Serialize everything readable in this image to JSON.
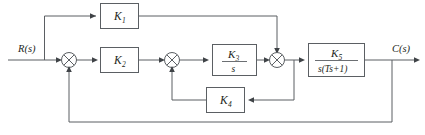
{
  "diagram": {
    "type": "block-diagram",
    "line_color": "#5b5f63",
    "text_color": "#1d1f21",
    "background": "#ffffff",
    "signals": {
      "input_label": "R(s)",
      "output_label": "C(s)"
    },
    "blocks": [
      {
        "id": "k1",
        "label": "K",
        "subscript": "1",
        "path": "feedforward-top"
      },
      {
        "id": "k2",
        "label": "K",
        "subscript": "2",
        "path": "forward-main"
      },
      {
        "id": "k3",
        "numerator": "K",
        "numerator_sub": "3",
        "denominator": "s",
        "path": "forward-main",
        "is_fraction": true
      },
      {
        "id": "k5",
        "numerator": "K",
        "numerator_sub": "5",
        "denominator": "s(Ts+1)",
        "path": "forward-main",
        "is_fraction": true
      },
      {
        "id": "k4",
        "label": "K",
        "subscript": "4",
        "path": "inner-feedback"
      }
    ],
    "summing_junctions": [
      {
        "id": "sum1",
        "glyph": "circle-x"
      },
      {
        "id": "sum2",
        "glyph": "circle-x"
      },
      {
        "id": "sum3",
        "glyph": "circle-x"
      }
    ],
    "loops": [
      {
        "id": "outer-feedback",
        "from": "output",
        "to": "sum1"
      },
      {
        "id": "inner-feedback",
        "from": "k5-input",
        "to": "sum2",
        "through": "k4"
      },
      {
        "id": "feedforward",
        "from": "input",
        "to": "sum3",
        "through": "k1"
      }
    ]
  }
}
